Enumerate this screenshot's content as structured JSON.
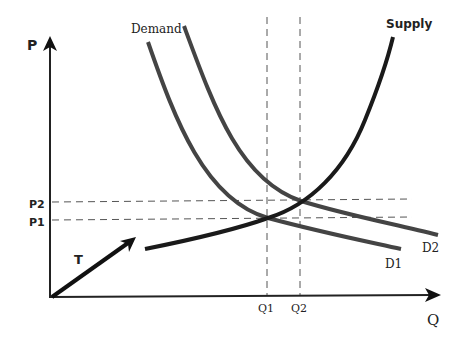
{
  "diagram": {
    "axes": {
      "y_label": "P",
      "x_label": "Q"
    },
    "curves": {
      "demand_label": "Demand",
      "supply_label": "Supply",
      "d1_label": "D1",
      "d2_label": "D2"
    },
    "ticks": {
      "p1": "P1",
      "p2": "P2",
      "q1": "Q1",
      "q2": "Q2"
    },
    "shift_arrow_label": "T",
    "colors": {
      "curve": "#444444",
      "supply": "#1a1a1a",
      "axis": "#222222",
      "dashed": "#555555",
      "text": "#222222"
    }
  }
}
